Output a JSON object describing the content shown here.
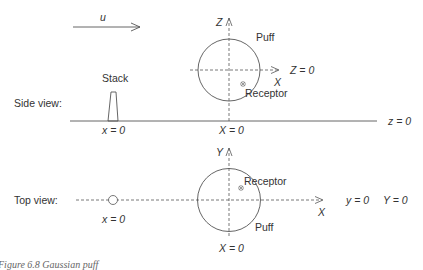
{
  "diagram": {
    "wind_label": "u",
    "side_view": {
      "title": "Side view:",
      "stack_label": "Stack",
      "puff_label": "Puff",
      "receptor_label": "Receptor",
      "Z_axis": "Z",
      "X_axis": "X",
      "Z0": "Z = 0",
      "x0": "x = 0",
      "X0": "X = 0",
      "z0": "z = 0"
    },
    "top_view": {
      "title": "Top view:",
      "receptor_label": "Receptor",
      "puff_label": "Puff",
      "Y_axis": "Y",
      "X_axis": "X",
      "x0": "x = 0",
      "X0": "X = 0",
      "y0": "y = 0",
      "Y0": "Y = 0"
    },
    "caption": "Figure 6.8   Gaussian puff"
  }
}
